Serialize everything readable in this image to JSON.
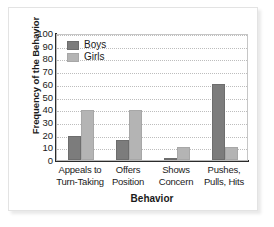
{
  "chart_data": {
    "type": "bar",
    "title": "",
    "xlabel": "Behavior",
    "ylabel": "Frequency of the Behavior",
    "categories": [
      "Appeals to\nTurn-Taking",
      "Offers\nPosition",
      "Shows\nConcern",
      "Pushes,\nPulls, Hits"
    ],
    "category_lines": [
      [
        "Appeals to",
        "Turn-Taking"
      ],
      [
        "Offers",
        "Position"
      ],
      [
        "Shows",
        "Concern"
      ],
      [
        "Pushes,",
        "Pulls, Hits"
      ]
    ],
    "series": [
      {
        "name": "Boys",
        "values": [
          19,
          16,
          1,
          60
        ],
        "color": "#7c7c7c"
      },
      {
        "name": "Girls",
        "values": [
          39,
          39,
          10,
          10
        ],
        "color": "#b4b4b4"
      }
    ],
    "ylim": [
      0,
      100
    ],
    "ytick_labels": [
      "100",
      "90",
      "80",
      "70",
      "60",
      "50",
      "40",
      "30",
      "20",
      "10",
      "0"
    ],
    "ytick_values": [
      100,
      90,
      80,
      70,
      60,
      50,
      40,
      30,
      20,
      10,
      0
    ],
    "grid": true,
    "legend_position": "top-left"
  }
}
